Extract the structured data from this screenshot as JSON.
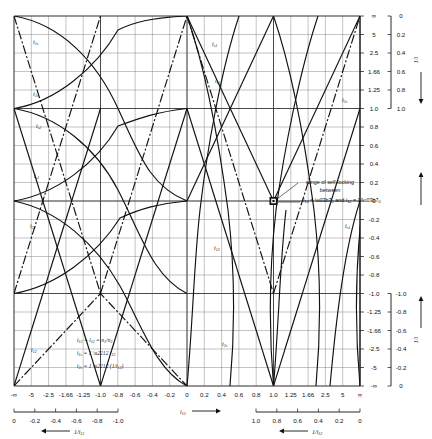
{
  "figure": {
    "plot_frame": {
      "x": 14,
      "y": 16,
      "w": 346,
      "h": 370
    }
  },
  "annotation": {
    "line1": "range of self-locking",
    "line2": "between",
    "line3_a": "i",
    "line3_a_sub": "12",
    "line3_eq1": "= η",
    "line3_eq1_sub": "0",
    "line3_and": "and",
    "line3_b": "i",
    "line3_b_sub": "12",
    "line3_eq2": "= 1/η",
    "line3_eq2_sub": "0",
    "full_text": "range of self-locking between i12 = η0 and i12 = 1/η0"
  },
  "formulas": [
    {
      "lhs": "i12",
      "rhs": "= i12 = n1/n2",
      "full": "i12 = i12 = n1/n2"
    },
    {
      "lhs": "i1s",
      "rhs": "= 1 - i12",
      "full": "i1s = 1 - i12"
    },
    {
      "lhs": "i2s",
      "rhs": "= 1 - (1/i12)",
      "full": "i2s = 1 - (1/i12)"
    }
  ],
  "curve_labels": [
    {
      "name": "i1s",
      "base": "i",
      "sub": "1s",
      "x": 33,
      "y": 44
    },
    {
      "name": "i2s",
      "base": "i",
      "sub": "2s",
      "x": 33,
      "y": 96
    },
    {
      "name": "is2",
      "base": "i",
      "sub": "s2",
      "x": 36,
      "y": 128
    },
    {
      "name": "is1",
      "base": "i",
      "sub": "s1",
      "x": 34,
      "y": 178
    },
    {
      "name": "i21",
      "base": "i",
      "sub": "21",
      "x": 32,
      "y": 228
    },
    {
      "name": "i12",
      "base": "i",
      "sub": "12",
      "x": 33,
      "y": 352
    },
    {
      "name": "is1b",
      "base": "i",
      "sub": "s1",
      "x": 213,
      "y": 45
    },
    {
      "name": "is2b",
      "base": "i",
      "sub": "s2",
      "x": 215,
      "y": 82
    },
    {
      "name": "i12b",
      "base": "i",
      "sub": "12",
      "x": 216,
      "y": 249
    },
    {
      "name": "i2sb",
      "base": "i",
      "sub": "2s",
      "x": 222,
      "y": 345
    },
    {
      "name": "i2sc",
      "base": "i",
      "sub": "2s",
      "x": 371,
      "y": 100
    },
    {
      "name": "is1c",
      "base": "i",
      "sub": "s1",
      "x": 374,
      "y": 226
    }
  ],
  "axes": {
    "bottom_main": {
      "name": "i12",
      "base": "i",
      "sub": "12",
      "arrow": "→",
      "ticks": [
        "-∞",
        "-5",
        "-2.5",
        "-1.66",
        "-1.25",
        "-1.0",
        "-0.8",
        "-0.6",
        "-0.4",
        "-0.2",
        "0",
        "0.2",
        "0.4",
        "0.6",
        "0.8",
        "1.0",
        "1.25",
        "1.66",
        "2.5",
        "5",
        "∞"
      ]
    },
    "bottom_left_sub": {
      "name": "1/i12",
      "base": "1/i",
      "sub": "12",
      "arrow": "←",
      "ticks": [
        "0",
        "-0.2",
        "-0.4",
        "-0.6",
        "-0.8",
        "-1.0"
      ]
    },
    "bottom_right_sub": {
      "name": "1/i12",
      "base": "1/i",
      "sub": "12",
      "arrow": "←",
      "ticks": [
        "1.0",
        "0.8",
        "0.6",
        "0.4",
        "0.2",
        "0"
      ]
    },
    "right_main": {
      "ticks": [
        "∞",
        "5",
        "2.5",
        "1.66",
        "1.25",
        "1.0",
        "0.8",
        "0.6",
        "0.4",
        "0.2",
        "0",
        "-0.2",
        "-0.4",
        "-0.6",
        "-0.8",
        "-1.0",
        "-1.25",
        "-1.66",
        "-2.5",
        "-5",
        "-∞"
      ]
    },
    "right_upper_sub": {
      "name": "1/i",
      "base": "1/i",
      "arrow": "↓",
      "ticks": [
        "0",
        "0.2",
        "0.4",
        "0.6",
        "0.8",
        "1.0"
      ]
    },
    "right_lower_sub": {
      "name": "1/i",
      "base": "1/i",
      "arrow": "↑",
      "ticks": [
        "-1.0",
        "-0.8",
        "-0.6",
        "-0.4",
        "-0.2",
        "0"
      ]
    }
  },
  "chart_data": {
    "type": "line",
    "xlabel": "i12",
    "ylabel": "i (ratio)",
    "grid": true,
    "legend": "inline curve labels",
    "x_ticks": [
      "-∞",
      "-5",
      "-2.5",
      "-1.66",
      "-1.25",
      "-1.0",
      "-0.8",
      "-0.6",
      "-0.4",
      "-0.2",
      "0",
      "0.2",
      "0.4",
      "0.6",
      "0.8",
      "1.0",
      "1.25",
      "1.66",
      "2.5",
      "5",
      "∞"
    ],
    "y_ticks": [
      "∞",
      "5",
      "2.5",
      "1.66",
      "1.25",
      "1.0",
      "0.8",
      "0.6",
      "0.4",
      "0.2",
      "0",
      "-0.2",
      "-0.4",
      "-0.6",
      "-0.8",
      "-1.0",
      "-1.25",
      "-1.66",
      "-2.5",
      "-5",
      "-∞"
    ],
    "xlim": [
      "-inf",
      "inf"
    ],
    "ylim": [
      "inf",
      "-inf"
    ],
    "series": [
      {
        "name": "i12",
        "note": "identity / straight diagonal chain"
      },
      {
        "name": "i21",
        "note": "reciprocal 1/i12"
      },
      {
        "name": "i1s",
        "note": "1 - i12"
      },
      {
        "name": "i2s",
        "note": "1 - 1/i12"
      },
      {
        "name": "is1",
        "note": "1/(1 - i12)"
      },
      {
        "name": "is2",
        "note": "1/(1 - 1/i12)"
      }
    ],
    "annotations": [
      {
        "text": "range of self-locking between i12 = η0 and i12 = 1/η0",
        "at_x": "1.0",
        "at_y": "0"
      }
    ]
  }
}
